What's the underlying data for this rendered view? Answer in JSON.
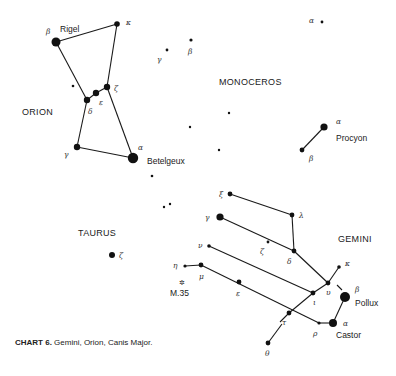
{
  "caption": {
    "label": "CHART 6.",
    "text": " Gemini, Orion, Canis Major."
  },
  "constellations": [
    {
      "name": "ORION",
      "x": 22,
      "y": 115
    },
    {
      "name": "MONOCEROS",
      "x": 219,
      "y": 85
    },
    {
      "name": "TAURUS",
      "x": 78,
      "y": 236
    },
    {
      "name": "GEMINI",
      "x": 338,
      "y": 242
    }
  ],
  "star_names": [
    {
      "name": "Rigel",
      "x": 60,
      "y": 32
    },
    {
      "name": "Betelgeux",
      "x": 147,
      "y": 164
    },
    {
      "name": "Procyon",
      "x": 336,
      "y": 141
    },
    {
      "name": "Pollux",
      "x": 355,
      "y": 306
    },
    {
      "name": "Castor",
      "x": 336,
      "y": 338
    },
    {
      "name": "M.35",
      "x": 170,
      "y": 296
    }
  ],
  "stars": [
    {
      "id": "ori-beta",
      "x": 56,
      "y": 42,
      "r": 4.5,
      "greek": "β",
      "gx": 46,
      "gy": 34
    },
    {
      "id": "ori-kappa",
      "x": 117,
      "y": 24,
      "r": 2.8,
      "greek": "κ",
      "gx": 126,
      "gy": 25
    },
    {
      "id": "ori-zeta",
      "x": 107,
      "y": 87,
      "r": 3.2,
      "greek": "ζ",
      "gx": 114,
      "gy": 91
    },
    {
      "id": "ori-epsilon",
      "x": 96,
      "y": 93,
      "r": 3.2,
      "greek": "ε",
      "gx": 99,
      "gy": 105
    },
    {
      "id": "ori-delta",
      "x": 87,
      "y": 100,
      "r": 3.2,
      "greek": "δ",
      "gx": 88,
      "gy": 114
    },
    {
      "id": "ori-gamma",
      "x": 77,
      "y": 147,
      "r": 3.2,
      "greek": "γ",
      "gx": 64,
      "gy": 157
    },
    {
      "id": "ori-alpha",
      "x": 133,
      "y": 158,
      "r": 5.2,
      "greek": "α",
      "gx": 138,
      "gy": 150
    },
    {
      "id": "ori-extra",
      "x": 73,
      "y": 86,
      "r": 1.3
    },
    {
      "id": "mon-beta",
      "x": 191,
      "y": 40,
      "r": 1.6,
      "greek": "β",
      "gx": 188,
      "gy": 54
    },
    {
      "id": "mon-gamma",
      "x": 167,
      "y": 50,
      "r": 1.4,
      "greek": "γ",
      "gx": 157,
      "gy": 62
    },
    {
      "id": "mon-alpha",
      "x": 322,
      "y": 22,
      "r": 1.4,
      "greek": "α",
      "gx": 309,
      "gy": 23
    },
    {
      "id": "mon-1",
      "x": 229,
      "y": 113,
      "r": 1.2
    },
    {
      "id": "mon-2",
      "x": 190,
      "y": 127,
      "r": 1.2
    },
    {
      "id": "mon-3",
      "x": 219,
      "y": 150,
      "r": 1.2
    },
    {
      "id": "mon-4",
      "x": 152,
      "y": 176,
      "r": 1.3
    },
    {
      "id": "mon-5",
      "x": 164,
      "y": 207,
      "r": 1.2
    },
    {
      "id": "mon-6",
      "x": 170,
      "y": 204,
      "r": 1.2
    },
    {
      "id": "cmi-alpha",
      "x": 324,
      "y": 127,
      "r": 3.6,
      "greek": "α",
      "gx": 336,
      "gy": 124
    },
    {
      "id": "cmi-beta",
      "x": 302,
      "y": 150,
      "r": 2.4,
      "greek": "β",
      "gx": 309,
      "gy": 161
    },
    {
      "id": "tau-zeta",
      "x": 112,
      "y": 255,
      "r": 3.0,
      "greek": "ζ",
      "gx": 119,
      "gy": 258
    },
    {
      "id": "gem-xi",
      "x": 230,
      "y": 194,
      "r": 2.4,
      "greek": "ξ",
      "gx": 219,
      "gy": 197
    },
    {
      "id": "gem-lambda",
      "x": 292,
      "y": 215,
      "r": 2.4,
      "greek": "λ",
      "gx": 299,
      "gy": 218
    },
    {
      "id": "gem-gamma",
      "x": 220,
      "y": 217,
      "r": 3.6,
      "greek": "γ",
      "gx": 205,
      "gy": 220
    },
    {
      "id": "gem-zeta",
      "x": 268,
      "y": 242,
      "r": 1.4,
      "greek": "ζ",
      "gx": 260,
      "gy": 254
    },
    {
      "id": "gem-delta",
      "x": 294,
      "y": 251,
      "r": 2.4,
      "greek": "δ",
      "gx": 287,
      "gy": 264
    },
    {
      "id": "gem-nu",
      "x": 209,
      "y": 246,
      "r": 1.8,
      "greek": "ν",
      "gx": 198,
      "gy": 248
    },
    {
      "id": "gem-eta",
      "x": 185,
      "y": 266,
      "r": 1.6,
      "greek": "η",
      "gx": 173,
      "gy": 268
    },
    {
      "id": "gem-mu",
      "x": 201,
      "y": 265,
      "r": 2.4,
      "greek": "μ",
      "gx": 199,
      "gy": 279
    },
    {
      "id": "gem-epsilon",
      "x": 239,
      "y": 282,
      "r": 2.4,
      "greek": "ε",
      "gx": 236,
      "gy": 296
    },
    {
      "id": "gem-iota",
      "x": 313,
      "y": 293,
      "r": 2.4,
      "greek": "ι",
      "gx": 313,
      "gy": 305
    },
    {
      "id": "gem-upsilon",
      "x": 328,
      "y": 283,
      "r": 2.4,
      "greek": "υ",
      "gx": 326,
      "gy": 295
    },
    {
      "id": "gem-kappa",
      "x": 339,
      "y": 267,
      "r": 1.8,
      "greek": "κ",
      "gx": 345,
      "gy": 266
    },
    {
      "id": "gem-tau",
      "x": 289,
      "y": 313,
      "r": 2.4,
      "greek": "τ",
      "gx": 282,
      "gy": 325
    },
    {
      "id": "gem-rho",
      "x": 319,
      "y": 323,
      "r": 1.6,
      "greek": "ρ",
      "gx": 313,
      "gy": 336
    },
    {
      "id": "gem-alpha",
      "x": 333,
      "y": 323,
      "r": 4.0,
      "greek": "α",
      "gx": 343,
      "gy": 326
    },
    {
      "id": "gem-beta",
      "x": 345,
      "y": 297,
      "r": 5.0,
      "greek": "β",
      "gx": 355,
      "gy": 292
    },
    {
      "id": "gem-theta",
      "x": 268,
      "y": 343,
      "r": 2.4,
      "greek": "θ",
      "gx": 265,
      "gy": 356
    }
  ],
  "lines": [
    [
      56,
      42,
      117,
      24
    ],
    [
      117,
      24,
      107,
      87
    ],
    [
      56,
      42,
      87,
      100
    ],
    [
      87,
      100,
      96,
      93
    ],
    [
      96,
      93,
      107,
      87
    ],
    [
      87,
      100,
      77,
      147
    ],
    [
      77,
      147,
      133,
      158
    ],
    [
      107,
      87,
      133,
      158
    ],
    [
      324,
      127,
      302,
      150
    ],
    [
      230,
      194,
      292,
      215
    ],
    [
      292,
      215,
      294,
      251
    ],
    [
      220,
      217,
      294,
      251
    ],
    [
      294,
      251,
      328,
      283
    ],
    [
      209,
      246,
      313,
      293
    ],
    [
      313,
      293,
      328,
      283
    ],
    [
      328,
      283,
      339,
      267
    ],
    [
      185,
      266,
      201,
      265
    ],
    [
      201,
      265,
      319,
      323
    ],
    [
      319,
      323,
      333,
      323
    ],
    [
      333,
      323,
      345,
      297
    ],
    [
      313,
      293,
      289,
      313
    ],
    [
      289,
      313,
      280,
      322
    ],
    [
      268,
      343,
      282,
      324
    ],
    [
      337,
      285,
      342,
      290
    ]
  ],
  "m35": {
    "symbol": "✲",
    "x": 179,
    "y": 285
  }
}
